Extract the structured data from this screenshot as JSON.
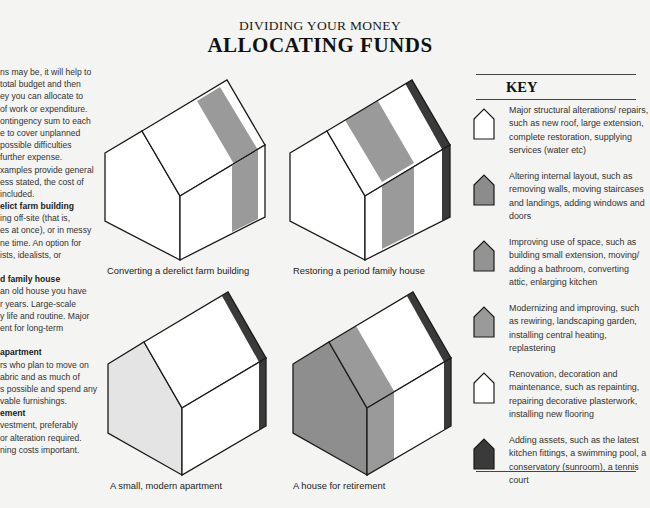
{
  "header": {
    "subtitle": "DIVIDING YOUR MONEY",
    "title": "ALLOCATING FUNDS"
  },
  "left_column": {
    "lines": [
      {
        "text": "ns may be, it will help to",
        "bold": false
      },
      {
        "text": "total budget and then",
        "bold": false
      },
      {
        "text": "ey you can allocate to",
        "bold": false
      },
      {
        "text": "of work or expenditure.",
        "bold": false
      },
      {
        "text": "ontingency sum to each",
        "bold": false
      },
      {
        "text": "e to cover unplanned",
        "bold": false
      },
      {
        "text": "possible difficulties",
        "bold": false
      },
      {
        "text": "further expense.",
        "bold": false
      },
      {
        "text": "xamples provide general",
        "bold": false
      },
      {
        "text": "ess stated, the cost of",
        "bold": false
      },
      {
        "text": "included.",
        "bold": false
      },
      {
        "text": "elict farm building",
        "bold": true
      },
      {
        "text": "ing off-site (that is,",
        "bold": false
      },
      {
        "text": "es at once), or in messy",
        "bold": false
      },
      {
        "text": "ne time. An option for",
        "bold": false
      },
      {
        "text": "ists, idealists, or",
        "bold": false
      },
      {
        "text": "",
        "bold": false
      },
      {
        "text": "d family house",
        "bold": true
      },
      {
        "text": "an old house you have",
        "bold": false
      },
      {
        "text": "r years. Large-scale",
        "bold": false
      },
      {
        "text": "y life and routine. Major",
        "bold": false
      },
      {
        "text": "ent for long-term",
        "bold": false
      },
      {
        "text": "",
        "bold": false
      },
      {
        "text": "apartment",
        "bold": true
      },
      {
        "text": "rs who plan to move on",
        "bold": false
      },
      {
        "text": "abric and as much of",
        "bold": false
      },
      {
        "text": "s possible and spend any",
        "bold": false
      },
      {
        "text": "vable furnishings.",
        "bold": false
      },
      {
        "text": "ement",
        "bold": true
      },
      {
        "text": "vestment, preferably",
        "bold": false
      },
      {
        "text": "or alteration required.",
        "bold": false
      },
      {
        "text": "ning costs important.",
        "bold": false
      }
    ]
  },
  "houses": [
    {
      "caption": "Converting a derelict farm building",
      "fill_colors": {
        "major": "#ffffff",
        "layout": "#9a9a9a",
        "renovation": "#ffffff",
        "assets": "none"
      }
    },
    {
      "caption": "Restoring a period family house",
      "fill_colors": {
        "major": "#ffffff",
        "layout": "#9a9a9a",
        "renovation": "#ffffff",
        "assets": "#3a3a3a"
      }
    },
    {
      "caption": "A small, modern apartment",
      "fill_colors": {
        "gable": "#e4e4e4",
        "renovation": "#ffffff",
        "assets": "#3a3a3a"
      }
    },
    {
      "caption": "A house for retirement",
      "fill_colors": {
        "gable": "#8e8e8e",
        "modernizing": "#9a9a9a",
        "renovation": "#ffffff",
        "assets": "#3a3a3a"
      }
    }
  ],
  "key": {
    "title": "KEY",
    "items": [
      {
        "icon": "white-house-icon",
        "color": "#ffffff",
        "text": "Major structural alterations/ repairs, such as new roof, large extension, complete restoration, supplying services (water etc)"
      },
      {
        "icon": "gray-house-icon",
        "color": "#8c8c8c",
        "text": "Altering internal layout, such as removing walls, moving staircases and landings, adding windows and doors"
      },
      {
        "icon": "gray-house-icon",
        "color": "#939393",
        "text": "Improving use of space, such as building small extension, moving/ adding a bathroom, converting attic, enlarging kitchen"
      },
      {
        "icon": "gray-house-icon",
        "color": "#9a9a9a",
        "text": "Modernizing and improving, such as rewiring, landscaping garden, installing central heating, replastering"
      },
      {
        "icon": "white-house-icon",
        "color": "#ffffff",
        "text": "Renovation, decoration and maintenance, such as repainting, repairing decorative plasterwork, installing new flooring"
      },
      {
        "icon": "dark-house-icon",
        "color": "#3a3a3a",
        "text": "Adding assets, such as the latest kitchen fittings, a swimming pool, a conservatory (sunroom), a tennis court"
      }
    ]
  },
  "colors": {
    "background": "#f4f4f2",
    "outline": "#1a1a1a",
    "mid_gray": "#9a9a9a",
    "dark": "#3a3a3a"
  }
}
